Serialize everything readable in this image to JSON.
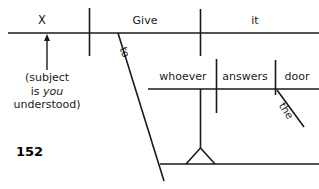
{
  "page": {
    "page_number": "152",
    "background_color": "#ffffff",
    "ink_color": "#1a1a1a"
  },
  "diagram": {
    "type": "reed-kellogg-sentence-diagram",
    "sentence": "Give it to whoever answers the door.",
    "main_clause": {
      "subject": "X",
      "verb": "Give",
      "direct_object": "it"
    },
    "subordinate_clause": {
      "subject": "whoever",
      "verb": "answers",
      "direct_object": "door",
      "article": "the"
    },
    "preposition": "to",
    "labels": {
      "subject": "X",
      "verb": "Give",
      "direct_object": "it",
      "preposition": "to",
      "clause_subject": "whoever",
      "clause_verb": "answers",
      "clause_object": "door",
      "clause_article": "the"
    },
    "note": {
      "line1": "(subject",
      "line2_prefix": "is ",
      "line2_italic": "you",
      "line3": "understood)"
    }
  }
}
